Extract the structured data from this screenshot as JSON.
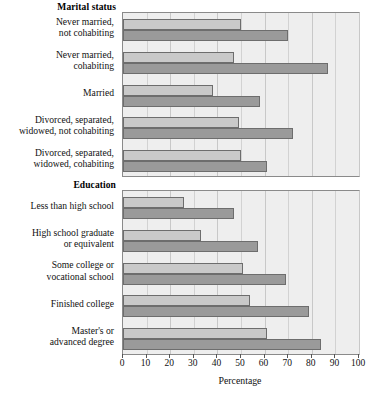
{
  "chart_data": {
    "type": "bar",
    "title": "",
    "orientation": "horizontal",
    "xlabel": "Percentage",
    "ylabel": "",
    "xlim": [
      0,
      100
    ],
    "xticks": [
      0,
      10,
      20,
      30,
      40,
      50,
      60,
      70,
      80,
      90,
      100
    ],
    "grid": true,
    "legend": "none",
    "series": [
      {
        "name": "light",
        "color": "#c9c9c9"
      },
      {
        "name": "dark",
        "color": "#9a9a9a"
      }
    ],
    "panels": [
      {
        "group_title": "Marital status",
        "categories": [
          "Never married,\nnot cohabiting",
          "Never married,\ncohabiting",
          "Married",
          "Divorced, separated,\nwidowed, not cohabiting",
          "Divorced, separated,\nwidowed, cohabiting"
        ],
        "series": [
          {
            "name": "light",
            "values": [
              50,
              47,
              38,
              49,
              50
            ]
          },
          {
            "name": "dark",
            "values": [
              70,
              87,
              58,
              72,
              61
            ]
          }
        ]
      },
      {
        "group_title": "Education",
        "categories": [
          "Less than high school",
          "High school graduate\nor equivalent",
          "Some college or\nvocational school",
          "Finished college",
          "Master's or\nadvanced degree"
        ],
        "series": [
          {
            "name": "light",
            "values": [
              26,
              33,
              51,
              54,
              61
            ]
          },
          {
            "name": "dark",
            "values": [
              47,
              57,
              69,
              79,
              84
            ]
          }
        ]
      }
    ]
  },
  "axis": {
    "tick_labels": [
      "0",
      "10",
      "20",
      "30",
      "40",
      "50",
      "60",
      "70",
      "80",
      "90",
      "100"
    ],
    "title": "Percentage"
  },
  "panel_titles": {
    "marital": "Marital status",
    "education": "Education"
  },
  "labels": {
    "marital": [
      "Never married,\nnot cohabiting",
      "Never married,\ncohabiting",
      "Married",
      "Divorced, separated,\nwidowed, not cohabiting",
      "Divorced, separated,\nwidowed, cohabiting"
    ],
    "education": [
      "Less than high school",
      "High school graduate\nor equivalent",
      "Some college or\nvocational school",
      "Finished college",
      "Master's or\nadvanced degree"
    ]
  }
}
